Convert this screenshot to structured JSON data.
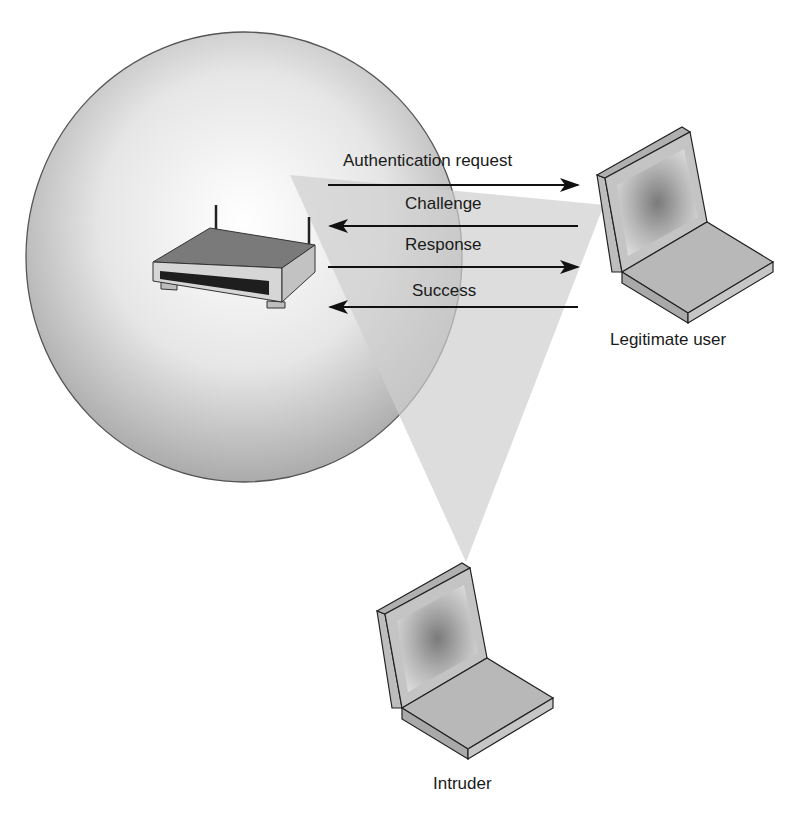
{
  "figure": {
    "type": "wireless-authentication-eavesdropping-diagram",
    "colors": {
      "background": "#ffffff",
      "coverage_area_light": "#f4f4f4",
      "coverage_area_dark": "#a8a8a8",
      "coverage_edge": "#555555",
      "eavesdrop_cone": "#d9d9d9",
      "device_top": "#7d7d7d",
      "device_side": "#c8c8c8",
      "outline": "#222222",
      "arrow": "#111111",
      "text": "#1a1a1a"
    }
  },
  "access_point": {
    "icon": "wireless-router-icon"
  },
  "messages": [
    {
      "label": "Authentication request",
      "direction": "to-user"
    },
    {
      "label": "Challenge",
      "direction": "to-access-point"
    },
    {
      "label": "Response",
      "direction": "to-user"
    },
    {
      "label": "Success",
      "direction": "to-access-point"
    }
  ],
  "nodes": {
    "legitimate_user": {
      "label": "Legitimate user",
      "icon": "laptop-icon"
    },
    "intruder": {
      "label": "Intruder",
      "icon": "laptop-icon"
    }
  }
}
